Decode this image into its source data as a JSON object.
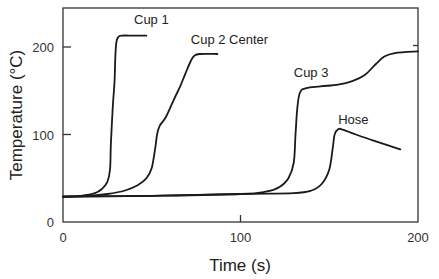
{
  "chart_data": {
    "type": "line",
    "title": "",
    "xlabel": "Time (s)",
    "ylabel": "Temperature (°C)",
    "xlim": [
      0,
      200
    ],
    "ylim": [
      0,
      240
    ],
    "grid": false,
    "legend": "none (inline series labels)",
    "xticks": [
      {
        "value": 0,
        "label": "0"
      },
      {
        "value": 100,
        "label": "100"
      },
      {
        "value": 200,
        "label": "200"
      }
    ],
    "yticks": [
      {
        "value": 0,
        "label": "0"
      },
      {
        "value": 100,
        "label": "100"
      },
      {
        "value": 200,
        "label": "200"
      }
    ],
    "series": [
      {
        "name": "Cup 1",
        "label": "Cup 1",
        "label_at": [
          40,
          226
        ],
        "points": [
          [
            0,
            29
          ],
          [
            10,
            30
          ],
          [
            18,
            33
          ],
          [
            22,
            38
          ],
          [
            25,
            46
          ],
          [
            26.5,
            60
          ],
          [
            27,
            90
          ],
          [
            28,
            130
          ],
          [
            29,
            160
          ],
          [
            29.5,
            190
          ],
          [
            30,
            205
          ],
          [
            31,
            211
          ],
          [
            33,
            213
          ],
          [
            40,
            213
          ],
          [
            47,
            213
          ]
        ]
      },
      {
        "name": "Cup 2 Center",
        "label": "Cup 2 Center",
        "label_at": [
          72,
          204
        ],
        "points": [
          [
            0,
            29
          ],
          [
            15,
            30
          ],
          [
            25,
            32
          ],
          [
            35,
            36
          ],
          [
            42,
            42
          ],
          [
            47,
            50
          ],
          [
            50,
            62
          ],
          [
            52,
            85
          ],
          [
            53,
            100
          ],
          [
            54.5,
            110
          ],
          [
            58,
            120
          ],
          [
            62,
            138
          ],
          [
            66,
            155
          ],
          [
            69,
            170
          ],
          [
            72,
            184
          ],
          [
            74,
            190
          ],
          [
            77,
            192
          ],
          [
            87,
            192
          ]
        ]
      },
      {
        "name": "Cup 3",
        "label": "Cup 3",
        "label_at": [
          130,
          166
        ],
        "points": [
          [
            0,
            29
          ],
          [
            50,
            30
          ],
          [
            100,
            32
          ],
          [
            115,
            35
          ],
          [
            122,
            40
          ],
          [
            127,
            50
          ],
          [
            130,
            68
          ],
          [
            131,
            100
          ],
          [
            132,
            130
          ],
          [
            133.5,
            148
          ],
          [
            137,
            153
          ],
          [
            145,
            155
          ],
          [
            155,
            157
          ],
          [
            163,
            161
          ],
          [
            170,
            168
          ],
          [
            176,
            180
          ],
          [
            181,
            189
          ],
          [
            187,
            193
          ],
          [
            200,
            195
          ]
        ]
      },
      {
        "name": "Hose",
        "label": "Hose",
        "label_at": [
          155,
          112
        ],
        "points": [
          [
            0,
            29
          ],
          [
            50,
            30
          ],
          [
            100,
            32
          ],
          [
            130,
            33
          ],
          [
            140,
            36
          ],
          [
            146,
            44
          ],
          [
            150,
            60
          ],
          [
            152,
            85
          ],
          [
            153,
            100
          ],
          [
            155,
            106
          ],
          [
            157,
            106
          ],
          [
            165,
            100
          ],
          [
            175,
            93
          ],
          [
            184,
            87
          ],
          [
            190,
            83
          ]
        ]
      }
    ]
  }
}
